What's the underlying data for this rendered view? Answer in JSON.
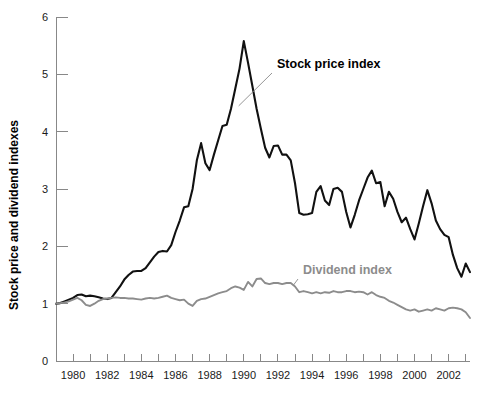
{
  "chart_data": {
    "type": "line",
    "title": "",
    "xlabel": "",
    "ylabel": "Stock price and dividend indexes",
    "xlim": [
      1979.0,
      2003.25
    ],
    "ylim": [
      0,
      6
    ],
    "grid": false,
    "legend_position": "inline-annotations",
    "y_ticks": [
      "0",
      "1",
      "2",
      "3",
      "4",
      "5",
      "6"
    ],
    "y_tick_values": [
      0,
      1,
      2,
      3,
      4,
      5,
      6
    ],
    "x_tick_values": [
      1979,
      1980,
      1981,
      1982,
      1983,
      1984,
      1985,
      1986,
      1987,
      1988,
      1989,
      1990,
      1991,
      1992,
      1993,
      1994,
      1995,
      1996,
      1997,
      1998,
      1999,
      2000,
      2001,
      2002,
      2003
    ],
    "x_tick_labels": [
      "",
      "1980",
      "",
      "1982",
      "",
      "1984",
      "",
      "1986",
      "",
      "1988",
      "",
      "1990",
      "",
      "1992",
      "",
      "1994",
      "",
      "1996",
      "",
      "1998",
      "",
      "2000",
      "",
      "2002",
      ""
    ],
    "annotations": [
      {
        "id": "stock",
        "text": "Stock price index",
        "color": "#000000",
        "points_to_x": 1989.7,
        "points_to_y": 4.45
      },
      {
        "id": "dividend",
        "text": "Dividend index",
        "color": "#8c8c8c",
        "points_to_x": 1992.9,
        "points_to_y": 1.32
      }
    ],
    "series": [
      {
        "name": "Stock price index",
        "color": "#111111",
        "x": [
          1979.0,
          1979.25,
          1979.5,
          1979.75,
          1980.0,
          1980.25,
          1980.5,
          1980.75,
          1981.0,
          1981.25,
          1981.5,
          1981.75,
          1982.0,
          1982.25,
          1982.5,
          1982.75,
          1983.0,
          1983.25,
          1983.5,
          1983.75,
          1984.0,
          1984.25,
          1984.5,
          1984.75,
          1985.0,
          1985.25,
          1985.5,
          1985.75,
          1986.0,
          1986.25,
          1986.5,
          1986.75,
          1987.0,
          1987.25,
          1987.5,
          1987.75,
          1988.0,
          1988.25,
          1988.5,
          1988.75,
          1989.0,
          1989.25,
          1989.5,
          1989.75,
          1990.0,
          1990.25,
          1990.5,
          1990.75,
          1991.0,
          1991.25,
          1991.5,
          1991.75,
          1992.0,
          1992.25,
          1992.5,
          1992.75,
          1993.0,
          1993.25,
          1993.5,
          1993.75,
          1994.0,
          1994.25,
          1994.5,
          1994.75,
          1995.0,
          1995.25,
          1995.5,
          1995.75,
          1996.0,
          1996.25,
          1996.5,
          1996.75,
          1997.0,
          1997.25,
          1997.5,
          1997.75,
          1998.0,
          1998.25,
          1998.5,
          1998.75,
          1999.0,
          1999.25,
          1999.5,
          1999.75,
          2000.0,
          2000.25,
          2000.5,
          2000.75,
          2001.0,
          2001.25,
          2001.5,
          2001.75,
          2002.0,
          2002.25,
          2002.5,
          2002.75,
          2003.0,
          2003.25
        ],
        "y": [
          1.0,
          1.01,
          1.04,
          1.07,
          1.1,
          1.15,
          1.16,
          1.13,
          1.14,
          1.13,
          1.11,
          1.09,
          1.08,
          1.1,
          1.2,
          1.3,
          1.42,
          1.5,
          1.56,
          1.57,
          1.57,
          1.62,
          1.72,
          1.82,
          1.9,
          1.92,
          1.91,
          2.02,
          2.25,
          2.45,
          2.68,
          2.7,
          3.0,
          3.5,
          3.8,
          3.45,
          3.33,
          3.6,
          3.85,
          4.1,
          4.12,
          4.4,
          4.75,
          5.1,
          5.58,
          5.2,
          4.8,
          4.4,
          4.05,
          3.72,
          3.55,
          3.75,
          3.76,
          3.6,
          3.6,
          3.5,
          3.1,
          2.58,
          2.55,
          2.56,
          2.58,
          2.95,
          3.05,
          2.8,
          2.72,
          3.0,
          3.02,
          2.95,
          2.6,
          2.33,
          2.55,
          2.8,
          3.0,
          3.2,
          3.32,
          3.1,
          3.12,
          2.7,
          2.95,
          2.83,
          2.6,
          2.42,
          2.5,
          2.3,
          2.12,
          2.4,
          2.7,
          2.98,
          2.75,
          2.45,
          2.3,
          2.2,
          2.16,
          1.85,
          1.62,
          1.47,
          1.7,
          1.55
        ],
        "note": "Indexed to 1.0 at start of 1979; peak 5.58 in early 1990"
      },
      {
        "name": "Dividend index",
        "color": "#8c8c8c",
        "x": [
          1979.0,
          1979.25,
          1979.5,
          1979.75,
          1980.0,
          1980.25,
          1980.5,
          1980.75,
          1981.0,
          1981.25,
          1981.5,
          1981.75,
          1982.0,
          1982.25,
          1982.5,
          1982.75,
          1983.0,
          1983.25,
          1983.5,
          1983.75,
          1984.0,
          1984.25,
          1984.5,
          1984.75,
          1985.0,
          1985.25,
          1985.5,
          1985.75,
          1986.0,
          1986.25,
          1986.5,
          1986.75,
          1987.0,
          1987.25,
          1987.5,
          1987.75,
          1988.0,
          1988.25,
          1988.5,
          1988.75,
          1989.0,
          1989.25,
          1989.5,
          1989.75,
          1990.0,
          1990.25,
          1990.5,
          1990.75,
          1991.0,
          1991.25,
          1991.5,
          1991.75,
          1992.0,
          1992.25,
          1992.5,
          1992.75,
          1993.0,
          1993.25,
          1993.5,
          1993.75,
          1994.0,
          1994.25,
          1994.5,
          1994.75,
          1995.0,
          1995.25,
          1995.5,
          1995.75,
          1996.0,
          1996.25,
          1996.5,
          1996.75,
          1997.0,
          1997.25,
          1997.5,
          1997.75,
          1998.0,
          1998.25,
          1998.5,
          1998.75,
          1999.0,
          1999.25,
          1999.5,
          1999.75,
          2000.0,
          2000.25,
          2000.5,
          2000.75,
          2001.0,
          2001.25,
          2001.5,
          2001.75,
          2002.0,
          2002.25,
          2002.5,
          2002.75,
          2003.0,
          2003.25
        ],
        "y": [
          1.0,
          1.01,
          1.02,
          1.04,
          1.07,
          1.1,
          1.06,
          0.98,
          0.96,
          1.0,
          1.05,
          1.08,
          1.09,
          1.1,
          1.11,
          1.1,
          1.1,
          1.09,
          1.09,
          1.08,
          1.07,
          1.09,
          1.1,
          1.09,
          1.1,
          1.12,
          1.14,
          1.1,
          1.08,
          1.06,
          1.07,
          1.0,
          0.96,
          1.05,
          1.08,
          1.09,
          1.12,
          1.15,
          1.18,
          1.2,
          1.22,
          1.27,
          1.3,
          1.28,
          1.24,
          1.38,
          1.3,
          1.43,
          1.44,
          1.36,
          1.34,
          1.36,
          1.36,
          1.34,
          1.36,
          1.36,
          1.3,
          1.2,
          1.22,
          1.2,
          1.18,
          1.2,
          1.18,
          1.2,
          1.19,
          1.22,
          1.2,
          1.2,
          1.22,
          1.22,
          1.2,
          1.21,
          1.2,
          1.16,
          1.2,
          1.15,
          1.12,
          1.1,
          1.05,
          1.02,
          0.98,
          0.94,
          0.9,
          0.88,
          0.9,
          0.86,
          0.88,
          0.9,
          0.88,
          0.92,
          0.9,
          0.88,
          0.92,
          0.93,
          0.92,
          0.9,
          0.85,
          0.75
        ],
        "note": "Indexed to 1.0 at start of 1979; peaks near 1.44 in 1991, declines to 0.75"
      }
    ]
  }
}
